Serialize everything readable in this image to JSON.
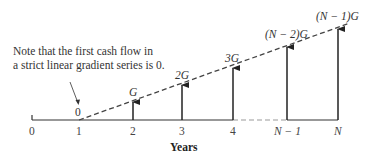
{
  "note": {
    "line1": "Note that the first cash flow in",
    "line2": "a strict linear gradient series is 0."
  },
  "axis": {
    "label": "Years",
    "ticks": [
      "0",
      "1",
      "2",
      "3",
      "4",
      "N − 1",
      "N"
    ]
  },
  "cash_flows": [
    {
      "period": "1",
      "label": "0"
    },
    {
      "period": "2",
      "label": "G"
    },
    {
      "period": "3",
      "label": "2G"
    },
    {
      "period": "4",
      "label": "3G"
    },
    {
      "period": "N − 1",
      "label": "(N − 2)G"
    },
    {
      "period": "N",
      "label": "(N − 1)G"
    }
  ],
  "colors": {
    "line": "#333333",
    "dashed": "#555555",
    "axis_gap": "#999999"
  }
}
